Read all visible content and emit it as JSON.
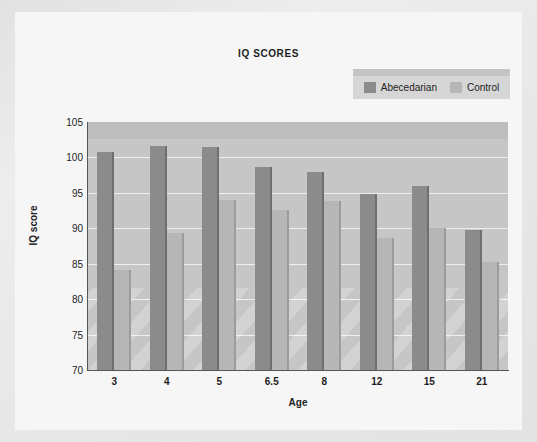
{
  "figure": {
    "background_color": "#f6f6f6",
    "page_background_color": "#e7e7e7"
  },
  "legend": {
    "position": "top-right",
    "entries": [
      {
        "label": "Abecedarian",
        "color": "#8b8b8b"
      },
      {
        "label": "Control",
        "color": "#b6b6b6"
      }
    ]
  },
  "chart_data": {
    "type": "bar",
    "title": "IQ SCORES",
    "xlabel": "Age",
    "ylabel": "IQ score",
    "categories": [
      "3",
      "4",
      "5",
      "6.5",
      "8",
      "12",
      "15",
      "21"
    ],
    "series": [
      {
        "name": "Abecedarian",
        "color": "#8b8b8b",
        "values": [
          100.8,
          101.6,
          101.5,
          98.6,
          97.9,
          94.8,
          96.0,
          89.7
        ]
      },
      {
        "name": "Control",
        "color": "#b6b6b6",
        "values": [
          84.1,
          89.3,
          94.0,
          92.6,
          93.8,
          88.7,
          90.1,
          85.3
        ]
      }
    ],
    "ylim": [
      70,
      105
    ],
    "yticks": [
      105,
      100,
      95,
      90,
      85,
      80,
      75,
      70
    ],
    "ytick_labels": [
      "105",
      "100",
      "95",
      "90",
      "85",
      "80",
      "75",
      "70"
    ],
    "grid": true,
    "grid_axis": "y",
    "plot_background_color": "#c6c6c6",
    "gridline_color": "#efefef",
    "legend_position": "top-right"
  }
}
